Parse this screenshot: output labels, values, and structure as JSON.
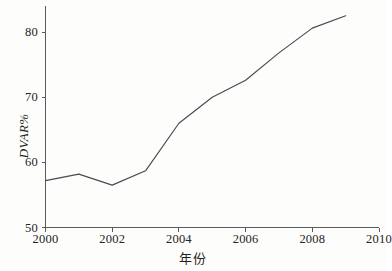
{
  "chart_data": {
    "type": "line",
    "title": "",
    "subtitle": "",
    "xlabel": "年份",
    "ylabel": "DVAR%",
    "x": [
      2000,
      2001,
      2002,
      2003,
      2004,
      2005,
      2006,
      2007,
      2008,
      2009
    ],
    "values": [
      57.2,
      58.2,
      56.5,
      58.7,
      66.0,
      70.0,
      72.6,
      76.8,
      80.6,
      82.5
    ],
    "series": [
      {
        "name": "DVAR%",
        "values": [
          57.2,
          58.2,
          56.5,
          58.7,
          66.0,
          70.0,
          72.6,
          76.8,
          80.6,
          82.5
        ]
      }
    ],
    "xlim": [
      2000,
      2010
    ],
    "ylim": [
      50,
      84
    ],
    "xticks": [
      2000,
      2002,
      2004,
      2006,
      2008,
      2010
    ],
    "xtick_labels": [
      "2000",
      "2002",
      "2004",
      "2006",
      "2008",
      "2010"
    ],
    "yticks": [
      50,
      60,
      70,
      80
    ],
    "ytick_labels": [
      "50",
      "60",
      "70",
      "80"
    ],
    "grid": false,
    "legend": false,
    "legend_position": "none",
    "line_color": "#4a4a52",
    "axis_color": "#5b5b5b",
    "background_color": "#fdfdfc",
    "markers": false,
    "annotations": []
  },
  "axis_titles": {
    "y": "DVAR%",
    "x": "年份"
  }
}
